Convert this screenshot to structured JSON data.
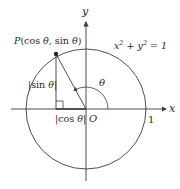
{
  "diagram": {
    "labels": {
      "y_axis": "y",
      "x_axis": "x",
      "origin": "O",
      "one": "1",
      "equation": "x² + y² = 1",
      "point": "P(cos θ, sin θ)",
      "theta": "θ",
      "sin_len": "|sin θ|",
      "cos_len": "|cos θ|"
    },
    "geometry": {
      "origin": [
        86,
        109
      ],
      "radius": 60,
      "point_P": [
        56,
        54
      ],
      "foot": [
        56,
        109
      ]
    },
    "colors": {
      "stroke": "#3a3a3a",
      "text": "#2a2a2a"
    }
  }
}
